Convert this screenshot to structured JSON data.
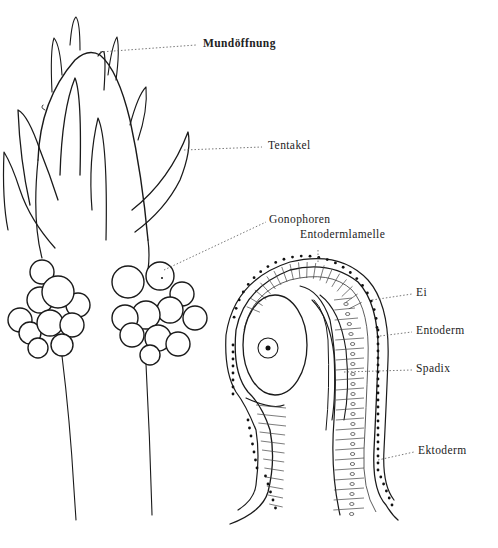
{
  "figure": {
    "left_panel": "hydroid polyp with tentacles and gonophore clusters",
    "right_panel": "longitudinal section through a gonophore",
    "labels": {
      "mundoeffnung": "Mundöffnung",
      "tentakel": "Tentakel",
      "gonophoren": "Gonophoren",
      "entodermlamelle": "Entodermlamelle",
      "ei": "Ei",
      "entoderm": "Entoderm",
      "spadix": "Spadix",
      "ektoderm": "Ektoderm"
    }
  }
}
